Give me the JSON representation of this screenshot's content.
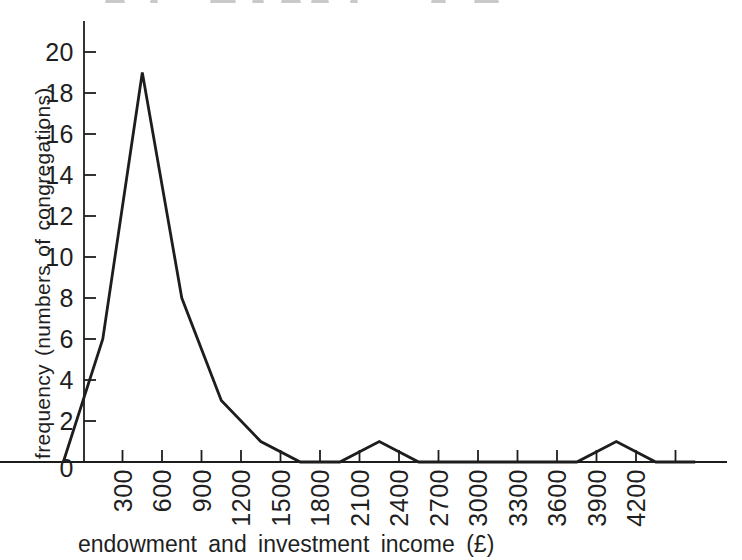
{
  "figure": {
    "background": "#ffffff",
    "ink_color": "#1d1d1d",
    "top_edge_artifact": "unreadable bottom fragments of a cropped caption line"
  },
  "chart_data": {
    "type": "line",
    "title": "",
    "xlabel": "endowment and investment income (£)",
    "ylabel": "frequency (numbers of congregations)",
    "series": [
      {
        "name": "frequency polygon",
        "x": [
          -150,
          150,
          450,
          750,
          1050,
          1350,
          1650,
          1950,
          2250,
          2550,
          2850,
          3150,
          3450,
          3750,
          4050,
          4350,
          4650
        ],
        "y": [
          0,
          6,
          19,
          8,
          3,
          1,
          0,
          0,
          1,
          0,
          0,
          0,
          0,
          0,
          1,
          0,
          0
        ]
      }
    ],
    "x_ticks": {
      "labeled": [
        300,
        600,
        900,
        1200,
        1500,
        1800,
        2100,
        2400,
        2700,
        3000,
        3300,
        3600,
        3900,
        4200
      ],
      "unlabeled": [
        4500
      ]
    },
    "x_tick_label_rotation_deg": -90,
    "y_ticks": [
      0,
      2,
      4,
      6,
      8,
      10,
      12,
      14,
      16,
      18,
      20
    ],
    "xlim": [
      0,
      4500
    ],
    "ylim": [
      0,
      20
    ],
    "grid": false,
    "legend": false,
    "line_color": "#1d1d1d"
  }
}
